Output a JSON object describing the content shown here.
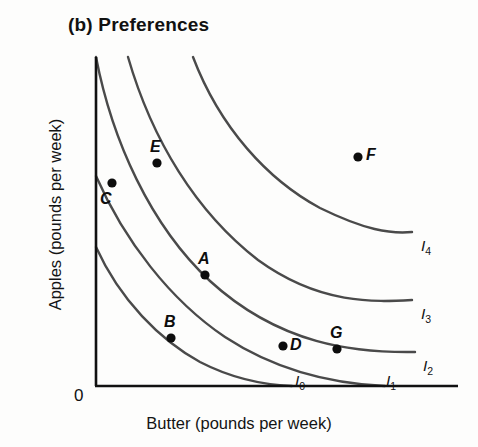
{
  "title": "(b)  Preferences",
  "axes": {
    "x_label": "Butter (pounds per week)",
    "y_label": "Apples (pounds per week)",
    "origin_label": "0"
  },
  "colors": {
    "axis": "#111111",
    "curve": "#4a4a4a",
    "point": "#0d0d0d",
    "background": "#fdfdfc"
  },
  "chart_data": {
    "type": "line",
    "title": "(b)  Preferences",
    "xlabel": "Butter (pounds per week)",
    "ylabel": "Apples (pounds per week)",
    "xlim": [
      0,
      100
    ],
    "ylim": [
      0,
      100
    ],
    "grid": false,
    "legend_position": "right-of-curve-ends",
    "series": [
      {
        "name": "I0",
        "label": "I",
        "subscript": "0",
        "label_x": 295,
        "label_y": 372,
        "path": "M 96 247 C 120 300 160 340 200 362 C 235 380 268 385 292 386"
      },
      {
        "name": "I1",
        "label": "I",
        "subscript": "1",
        "label_x": 386,
        "label_y": 372,
        "path": "M 96 176 C 124 240 170 300 225 337 C 280 373 340 384 385 386"
      },
      {
        "name": "I2",
        "label": "I",
        "subscript": "2",
        "label_x": 423,
        "label_y": 357,
        "path": "M 96 57 C 112 140 150 225 210 281 C 280 345 355 353 415 352"
      },
      {
        "name": "I3",
        "label": "I",
        "subscript": "3",
        "label_x": 421,
        "label_y": 305,
        "path": "M 128 57 C 152 140 196 212 258 260 C 320 305 375 302 412 300"
      },
      {
        "name": "I4",
        "label": "I",
        "subscript": "4",
        "label_x": 421,
        "label_y": 237,
        "path": "M 193 57 C 220 128 268 180 320 208 C 365 230 390 234 412 232"
      }
    ],
    "points": [
      {
        "name": "A",
        "cx": 205,
        "cy": 275,
        "label_x": 198,
        "label_y": 250,
        "on_curve": "I2"
      },
      {
        "name": "B",
        "cx": 171,
        "cy": 338,
        "label_x": 164,
        "label_y": 313,
        "on_curve": "I1"
      },
      {
        "name": "C",
        "cx": 112,
        "cy": 183,
        "label_x": 100,
        "label_y": 190,
        "on_curve": "I2"
      },
      {
        "name": "D",
        "cx": 283,
        "cy": 346,
        "label_x": 290,
        "label_y": 336,
        "on_curve": "I2"
      },
      {
        "name": "E",
        "cx": 157,
        "cy": 163,
        "label_x": 150,
        "label_y": 138,
        "on_curve": "none"
      },
      {
        "name": "F",
        "cx": 358,
        "cy": 157,
        "label_x": 366,
        "label_y": 146,
        "on_curve": "none"
      },
      {
        "name": "G",
        "cx": 337,
        "cy": 349,
        "label_x": 330,
        "label_y": 324,
        "on_curve": "I2"
      }
    ]
  }
}
